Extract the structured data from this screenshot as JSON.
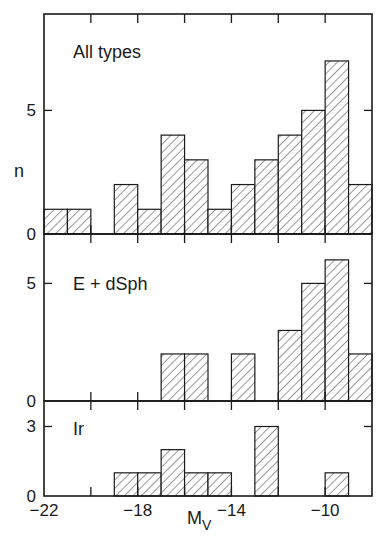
{
  "chart_data": {
    "type": "bar",
    "subtype": "histogram",
    "xlabel": "M_V",
    "xlabel_main": "M",
    "xlabel_sub": "V",
    "ylabel": "n",
    "xlim": [
      -22,
      -8
    ],
    "bin_width": 1,
    "x_ticks": [
      -22,
      -20,
      -18,
      -16,
      -14,
      -12,
      -10,
      -8
    ],
    "x_tick_labels": [
      {
        "value": -22,
        "label": "−22"
      },
      {
        "value": -18,
        "label": "−18"
      },
      {
        "value": -14,
        "label": "−14"
      },
      {
        "value": -10,
        "label": "−10"
      }
    ],
    "hatch": "diagonal",
    "grid": false,
    "legend": null,
    "panels": [
      {
        "label": "All types",
        "ylim": [
          0,
          8.9
        ],
        "y_ticks": [
          0,
          5
        ],
        "y_tick_labels": [
          "0",
          "5"
        ],
        "bins": [
          {
            "left": -22,
            "right": -21,
            "count": 1
          },
          {
            "left": -21,
            "right": -20,
            "count": 1
          },
          {
            "left": -20,
            "right": -19,
            "count": 0
          },
          {
            "left": -19,
            "right": -18,
            "count": 2
          },
          {
            "left": -18,
            "right": -17,
            "count": 1
          },
          {
            "left": -17,
            "right": -16,
            "count": 4
          },
          {
            "left": -16,
            "right": -15,
            "count": 3
          },
          {
            "left": -15,
            "right": -14,
            "count": 1
          },
          {
            "left": -14,
            "right": -13,
            "count": 2
          },
          {
            "left": -13,
            "right": -12,
            "count": 3
          },
          {
            "left": -12,
            "right": -11,
            "count": 4
          },
          {
            "left": -11,
            "right": -10,
            "count": 5
          },
          {
            "left": -10,
            "right": -9,
            "count": 7
          },
          {
            "left": -9,
            "right": -8,
            "count": 2
          }
        ]
      },
      {
        "label": "E + dSph",
        "ylim": [
          0,
          7.1
        ],
        "y_ticks": [
          0,
          5
        ],
        "y_tick_labels": [
          "0",
          "5"
        ],
        "bins": [
          {
            "left": -17,
            "right": -16,
            "count": 2
          },
          {
            "left": -16,
            "right": -15,
            "count": 2
          },
          {
            "left": -14,
            "right": -13,
            "count": 2
          },
          {
            "left": -12,
            "right": -11,
            "count": 3
          },
          {
            "left": -11,
            "right": -10,
            "count": 5
          },
          {
            "left": -10,
            "right": -9,
            "count": 6
          },
          {
            "left": -9,
            "right": -8,
            "count": 2
          }
        ]
      },
      {
        "label": "Ir",
        "ylim": [
          0,
          4.1
        ],
        "y_ticks": [
          0,
          3
        ],
        "y_tick_labels": [
          "0",
          "3"
        ],
        "bins": [
          {
            "left": -19,
            "right": -18,
            "count": 1
          },
          {
            "left": -18,
            "right": -17,
            "count": 1
          },
          {
            "left": -17,
            "right": -16,
            "count": 2
          },
          {
            "left": -16,
            "right": -15,
            "count": 1
          },
          {
            "left": -15,
            "right": -14,
            "count": 1
          },
          {
            "left": -13,
            "right": -12,
            "count": 3
          },
          {
            "left": -10,
            "right": -9,
            "count": 1
          }
        ]
      }
    ]
  },
  "layout": {
    "plot_left": 44,
    "plot_right": 372,
    "panels_px": [
      {
        "top": 14,
        "bottom": 234
      },
      {
        "top": 234,
        "bottom": 401
      },
      {
        "top": 401,
        "bottom": 496
      }
    ]
  }
}
